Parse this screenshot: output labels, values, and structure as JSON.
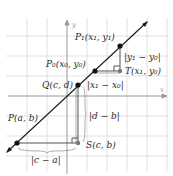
{
  "diagram": {
    "type": "coordinate-geometry",
    "axes": {
      "x_label": "x",
      "y_label": "y"
    },
    "points": {
      "P": {
        "label": "P(a, b)"
      },
      "Q": {
        "label": "Q(c, d)"
      },
      "S": {
        "label": "S(c, b)"
      },
      "P0": {
        "label": "P₀(x₀, y₀)"
      },
      "P1": {
        "label": "P₁(x₁, y₁)"
      },
      "T": {
        "label": "T(x₁, y₀)"
      }
    },
    "distances": {
      "c_minus_a": "|c − a|",
      "d_minus_b": "|d − b|",
      "x1_minus_x0": "|x₁ − x₀|",
      "y1_minus_y0": "|y₁ − y₀|"
    },
    "colors": {
      "grid": "#d4d4d4",
      "axis": "#9a9a9a",
      "line": "#1a1a1a",
      "leg": "#555555"
    }
  }
}
